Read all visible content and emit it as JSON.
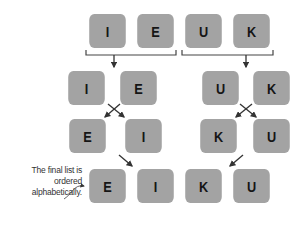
{
  "diagram": {
    "type": "merge-sort-illustration",
    "rows": [
      {
        "name": "initial-list",
        "items": [
          "I",
          "E",
          "U",
          "K"
        ]
      },
      {
        "name": "split-halves",
        "groups": [
          [
            "I",
            "E"
          ],
          [
            "U",
            "K"
          ]
        ]
      },
      {
        "name": "sorted-halves",
        "groups": [
          [
            "E",
            "I"
          ],
          [
            "K",
            "U"
          ]
        ]
      },
      {
        "name": "merged-list",
        "items": [
          "E",
          "I",
          "K",
          "U"
        ]
      }
    ],
    "annotation": {
      "line1": "The final list is",
      "line2": "ordered",
      "line3": "alphabetically."
    },
    "colors": {
      "box_fill": "#a3a3a3",
      "letter": "#151515",
      "line": "#333333",
      "annotation_text": "#333333"
    }
  }
}
